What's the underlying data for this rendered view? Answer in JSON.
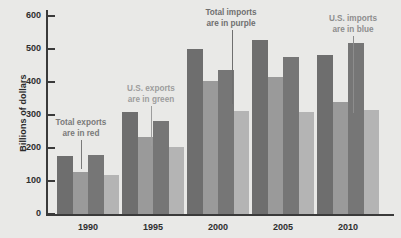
{
  "chart_data": {
    "type": "bar",
    "title": "",
    "subtitle": "",
    "xlabel": "",
    "ylabel": "Billions of dollars",
    "categories": [
      "1990",
      "1995",
      "2000",
      "2005",
      "2010"
    ],
    "ylim": [
      0,
      600
    ],
    "ytick_values": [
      0,
      100,
      200,
      300,
      400,
      500,
      600
    ],
    "ytick_labels": [
      "0",
      "100",
      "200",
      "300",
      "400",
      "500",
      "600"
    ],
    "grid": false,
    "legend_position": "inline-annotations",
    "series": [
      {
        "name": "Total exports",
        "color_name": "red",
        "color": "#6e6e6e",
        "values": [
          175,
          308,
          500,
          527,
          482
        ]
      },
      {
        "name": "U.S. exports",
        "color_name": "green",
        "color": "#9a9a9a",
        "values": [
          128,
          232,
          402,
          415,
          340
        ]
      },
      {
        "name": "Total imports",
        "color_name": "purple",
        "color": "#767676",
        "values": [
          178,
          282,
          435,
          475,
          518
        ]
      },
      {
        "name": "U.S. imports",
        "color_name": "blue",
        "color": "#b4b4b4",
        "values": [
          118,
          202,
          312,
          310,
          315
        ]
      }
    ],
    "annotations": [
      {
        "id": "total-exports",
        "line1": "Total exports",
        "line2": "are in red",
        "text_color": "#7a7a7a",
        "leader_color": "#7a7a7a"
      },
      {
        "id": "us-exports",
        "line1": "U.S. exports",
        "line2": "are in green",
        "text_color": "#9d9d9d",
        "leader_color": "#9d9d9d"
      },
      {
        "id": "total-imports",
        "line1": "Total imports",
        "line2": "are in purple",
        "text_color": "#6f6f6f",
        "leader_color": "#6f6f6f"
      },
      {
        "id": "us-imports",
        "line1": "U.S. imports",
        "line2": "are in blue",
        "text_color": "#8d8d8d",
        "leader_color": "#8d8d8d"
      }
    ]
  },
  "axis": {
    "y_title": "Billions of dollars",
    "ticks": [
      "600",
      "500",
      "400",
      "300",
      "200",
      "100",
      "0"
    ],
    "x_labels": [
      "1990",
      "1995",
      "2000",
      "2005",
      "2010"
    ]
  },
  "annotations": {
    "total_exports_l1": "Total exports",
    "total_exports_l2": "are in red",
    "us_exports_l1": "U.S. exports",
    "us_exports_l2": "are in green",
    "total_imports_l1": "Total imports",
    "total_imports_l2": "are in purple",
    "us_imports_l1": "U.S. imports",
    "us_imports_l2": "are in blue"
  },
  "colors": {
    "background": "#e9e9e7",
    "axis": "#3a3a3a",
    "series_1": "#6e6e6e",
    "series_2": "#9a9a9a",
    "series_3": "#767676",
    "series_4": "#b4b4b4"
  }
}
